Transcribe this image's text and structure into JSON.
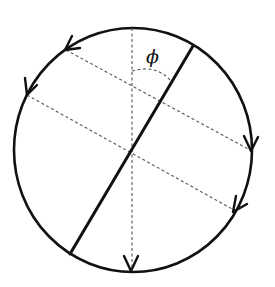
{
  "diagram": {
    "title": "",
    "labels": {
      "angle": "ϕ"
    },
    "circle": {
      "cx": 133,
      "cy": 150,
      "rx": 119,
      "ry": 122,
      "stroke": "#111111",
      "stroke_width": 2.6
    },
    "thick_diameter": {
      "x1": 193,
      "y1": 46,
      "x2": 70,
      "y2": 254,
      "stroke_width": 3
    },
    "vertical_dashed_axis": {
      "x1": 132,
      "y1": 28,
      "x2": 132,
      "y2": 270
    },
    "dashed_chords": [
      {
        "name": "upper-chord",
        "x1": 66,
        "y1": 50,
        "x2": 250,
        "y2": 150
      },
      {
        "name": "lower-chord",
        "x1": 27,
        "y1": 95,
        "x2": 234,
        "y2": 210
      }
    ],
    "angle_arc": {
      "description": "dashed arc between vertical axis and thick diameter, marking angle phi"
    },
    "arrowheads": [
      {
        "name": "arrow-top-left",
        "x": 67,
        "y": 49,
        "direction": "down-left"
      },
      {
        "name": "arrow-left",
        "x": 27,
        "y": 92,
        "direction": "down"
      },
      {
        "name": "arrow-right",
        "x": 251,
        "y": 148,
        "direction": "down"
      },
      {
        "name": "arrow-lower-right",
        "x": 235,
        "y": 209,
        "direction": "down-left"
      },
      {
        "name": "arrow-bottom",
        "x": 131,
        "y": 271,
        "direction": "down"
      }
    ],
    "colors": {
      "line": "#111111",
      "dashed": "#555555",
      "background": "#ffffff"
    }
  }
}
